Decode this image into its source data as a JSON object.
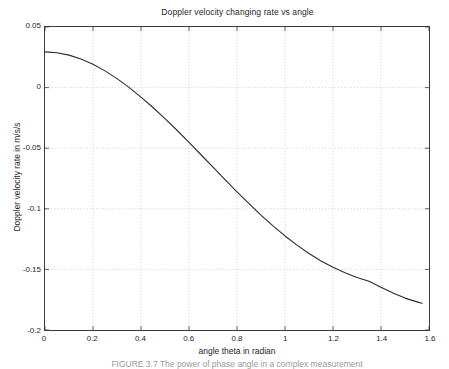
{
  "figure": {
    "caption": "FIGURE 3.7   The power of phase angle in a complex measurement"
  },
  "chart_data": {
    "type": "line",
    "title": "Doppler velocity changing rate vs angle",
    "xlabel": "angle theta in radian",
    "ylabel": "Doppler velocity rate in m/s/s",
    "xlim": [
      0,
      1.6
    ],
    "ylim": [
      -0.2,
      0.05
    ],
    "grid": true,
    "legend": null,
    "xticks": [
      "0",
      "0.2",
      "0.4",
      "0.6",
      "0.8",
      "1",
      "1.2",
      "1.4",
      "1.6"
    ],
    "xtick_values": [
      0,
      0.2,
      0.4,
      0.6,
      0.8,
      1,
      1.2,
      1.4,
      1.6
    ],
    "yticks": [
      "0.05",
      "0",
      "-0.05",
      "-0.1",
      "-0.15",
      "-0.2"
    ],
    "ytick_values": [
      0.05,
      0,
      -0.05,
      -0.1,
      -0.15,
      -0.2
    ],
    "line_color": "#2b2b2b",
    "line_width": 1.1,
    "series": [
      {
        "name": "Doppler velocity changing rate",
        "x": [
          0,
          0.05,
          0.1,
          0.15,
          0.2,
          0.25,
          0.3,
          0.35,
          0.4,
          0.45,
          0.5,
          0.55,
          0.6,
          0.65,
          0.7,
          0.75,
          0.8,
          0.85,
          0.9,
          0.95,
          1.0,
          1.05,
          1.1,
          1.15,
          1.2,
          1.25,
          1.3,
          1.35,
          1.4,
          1.45,
          1.5,
          1.55,
          1.5708
        ],
        "y": [
          0.0295,
          0.0288,
          0.0268,
          0.0236,
          0.0192,
          0.0138,
          0.0074,
          0.0002,
          -0.0078,
          -0.0164,
          -0.0256,
          -0.0352,
          -0.0452,
          -0.0554,
          -0.0656,
          -0.0759,
          -0.086,
          -0.0958,
          -0.1052,
          -0.1141,
          -0.1224,
          -0.13,
          -0.1369,
          -0.143,
          -0.1483,
          -0.1528,
          -0.1566,
          -0.1598,
          -0.1647,
          -0.1695,
          -0.1737,
          -0.1768,
          -0.178
        ],
        "annotations": {
          "y_at_0": 0.0295,
          "zero_crossing_x": 0.3501,
          "y_at_1.2": -0.1483,
          "y_at_end": -0.178
        }
      }
    ]
  }
}
